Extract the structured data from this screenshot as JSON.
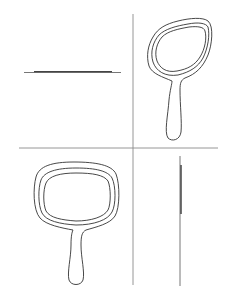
{
  "diagram": {
    "views": [
      {
        "id": "top-left",
        "label": "side view (thin profile, horizontal)"
      },
      {
        "id": "top-right",
        "label": "perspective view"
      },
      {
        "id": "bottom-left",
        "label": "front view"
      },
      {
        "id": "bottom-right",
        "label": "side view (thin profile, vertical)"
      }
    ],
    "colors": {
      "stroke": "#333333",
      "divider": "#888888",
      "background": "#ffffff"
    }
  }
}
